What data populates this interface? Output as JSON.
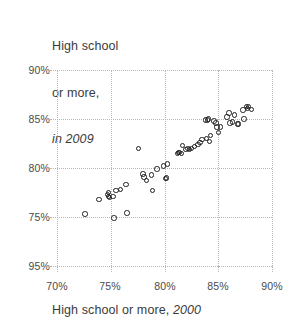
{
  "chart_data": {
    "type": "scatter",
    "title": "",
    "ylabel_lines": [
      "High school",
      "or more,",
      "in 2009"
    ],
    "xlabel_prefix": "High school or more, ",
    "xlabel_year": "2000",
    "xlabel": "High school or more, 2000",
    "ylabel": "High school or more, in 2009",
    "xlim": [
      70,
      90
    ],
    "ylim": [
      75,
      95
    ],
    "xticks": [
      70,
      75,
      80,
      85,
      90
    ],
    "yticks": [
      75,
      80,
      85,
      90,
      95
    ],
    "xtick_labels": [
      "70%",
      "75%",
      "80%",
      "85%",
      "90%"
    ],
    "ytick_labels": [
      "75%",
      "80%",
      "85%",
      "90%",
      "95%"
    ],
    "grid": true,
    "legend": "none",
    "marker": "open-circle",
    "marker_color": "#1f1f1f",
    "points": [
      {
        "x": 72.6,
        "y": 80.3
      },
      {
        "x": 73.9,
        "y": 81.8
      },
      {
        "x": 74.7,
        "y": 82.3
      },
      {
        "x": 74.8,
        "y": 82.1
      },
      {
        "x": 74.8,
        "y": 82.5
      },
      {
        "x": 74.9,
        "y": 82.0
      },
      {
        "x": 75.2,
        "y": 82.1
      },
      {
        "x": 75.3,
        "y": 79.9
      },
      {
        "x": 75.5,
        "y": 82.7
      },
      {
        "x": 75.9,
        "y": 82.8
      },
      {
        "x": 76.4,
        "y": 83.3
      },
      {
        "x": 76.5,
        "y": 80.4
      },
      {
        "x": 77.6,
        "y": 87.0
      },
      {
        "x": 78.0,
        "y": 84.4
      },
      {
        "x": 78.1,
        "y": 84.1
      },
      {
        "x": 78.3,
        "y": 83.7
      },
      {
        "x": 78.8,
        "y": 84.3
      },
      {
        "x": 78.9,
        "y": 82.7
      },
      {
        "x": 79.3,
        "y": 84.9
      },
      {
        "x": 79.9,
        "y": 85.2
      },
      {
        "x": 80.1,
        "y": 83.9
      },
      {
        "x": 80.2,
        "y": 84.0
      },
      {
        "x": 80.3,
        "y": 85.4
      },
      {
        "x": 81.2,
        "y": 86.5
      },
      {
        "x": 81.3,
        "y": 86.6
      },
      {
        "x": 81.4,
        "y": 86.6
      },
      {
        "x": 81.6,
        "y": 86.5
      },
      {
        "x": 81.7,
        "y": 87.3
      },
      {
        "x": 82.0,
        "y": 86.9
      },
      {
        "x": 82.2,
        "y": 87.0
      },
      {
        "x": 82.3,
        "y": 86.9
      },
      {
        "x": 82.5,
        "y": 87.0
      },
      {
        "x": 82.8,
        "y": 87.2
      },
      {
        "x": 83.1,
        "y": 87.4
      },
      {
        "x": 83.3,
        "y": 87.6
      },
      {
        "x": 83.5,
        "y": 87.9
      },
      {
        "x": 83.8,
        "y": 89.9
      },
      {
        "x": 83.9,
        "y": 88.0
      },
      {
        "x": 84.0,
        "y": 89.9
      },
      {
        "x": 84.1,
        "y": 90.0
      },
      {
        "x": 84.2,
        "y": 87.7
      },
      {
        "x": 84.3,
        "y": 88.3
      },
      {
        "x": 84.6,
        "y": 89.8
      },
      {
        "x": 84.8,
        "y": 89.6
      },
      {
        "x": 84.9,
        "y": 89.2
      },
      {
        "x": 85.0,
        "y": 88.6
      },
      {
        "x": 85.2,
        "y": 89.2
      },
      {
        "x": 85.8,
        "y": 90.2
      },
      {
        "x": 86.0,
        "y": 90.6
      },
      {
        "x": 86.1,
        "y": 89.6
      },
      {
        "x": 86.3,
        "y": 89.7
      },
      {
        "x": 86.5,
        "y": 90.4
      },
      {
        "x": 86.8,
        "y": 89.5
      },
      {
        "x": 86.9,
        "y": 89.5
      },
      {
        "x": 87.3,
        "y": 90.9
      },
      {
        "x": 87.4,
        "y": 90.0
      },
      {
        "x": 87.6,
        "y": 91.3
      },
      {
        "x": 87.7,
        "y": 91.1
      },
      {
        "x": 87.8,
        "y": 91.3
      },
      {
        "x": 88.1,
        "y": 91.0
      }
    ]
  }
}
